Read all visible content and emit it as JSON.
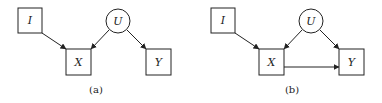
{
  "panels": [
    {
      "caption": "(a)",
      "nodes": [
        {
          "id": "I",
          "label": "I",
          "shape": "square"
        },
        {
          "id": "U",
          "label": "U",
          "shape": "circle"
        },
        {
          "id": "X",
          "label": "X",
          "shape": "square"
        },
        {
          "id": "Y",
          "label": "Y",
          "shape": "square"
        }
      ],
      "edges": [
        {
          "from": "I",
          "to": "X"
        },
        {
          "from": "U",
          "to": "X"
        },
        {
          "from": "U",
          "to": "Y"
        }
      ]
    },
    {
      "caption": "(b)",
      "nodes": [
        {
          "id": "I",
          "label": "I",
          "shape": "square"
        },
        {
          "id": "U",
          "label": "U",
          "shape": "circle"
        },
        {
          "id": "X",
          "label": "X",
          "shape": "square"
        },
        {
          "id": "Y",
          "label": "Y",
          "shape": "square"
        }
      ],
      "edges": [
        {
          "from": "I",
          "to": "X"
        },
        {
          "from": "U",
          "to": "X"
        },
        {
          "from": "U",
          "to": "Y"
        },
        {
          "from": "X",
          "to": "Y"
        }
      ]
    }
  ]
}
